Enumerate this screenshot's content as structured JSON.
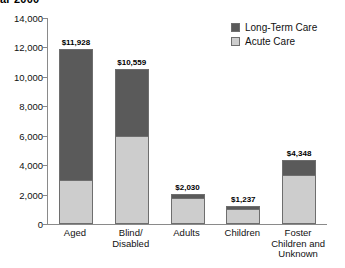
{
  "chart_data": {
    "type": "bar",
    "title": "ar 2000",
    "xlabel": "",
    "ylabel": "",
    "ylim": [
      0,
      14000
    ],
    "ytick_step": 2000,
    "grid": false,
    "stacked": true,
    "legend_position": "top-right",
    "ytick_labels": [
      "14,000",
      "12,000",
      "10,000",
      "8,000",
      "6,000",
      "4,000",
      "2,000",
      "0"
    ],
    "ytick_values": [
      14000,
      12000,
      10000,
      8000,
      6000,
      4000,
      2000,
      0
    ],
    "categories": [
      "Aged",
      "Blind/ Disabled",
      "Adults",
      "Children",
      "Foster Children and Unknown"
    ],
    "category_lines": [
      [
        "Aged"
      ],
      [
        "Blind/",
        "Disabled"
      ],
      [
        "Adults"
      ],
      [
        "Children"
      ],
      [
        "Foster",
        "Children and",
        "Unknown"
      ]
    ],
    "series": [
      {
        "name": "Acute Care",
        "color": "#cdcdcd",
        "values": [
          3000,
          6000,
          1780,
          1050,
          3350
        ]
      },
      {
        "name": "Long-Term Care",
        "color": "#5a5a5a",
        "values": [
          8928,
          4559,
          250,
          187,
          998
        ]
      }
    ],
    "totals": [
      11928,
      10559,
      2030,
      1237,
      4348
    ],
    "total_labels": [
      "$11,928",
      "$10,559",
      "$2,030",
      "$1,237",
      "$4,348"
    ]
  },
  "legend": {
    "items": [
      {
        "label": "Long-Term Care",
        "color": "#5a5a5a"
      },
      {
        "label": "Acute Care",
        "color": "#cdcdcd"
      }
    ]
  }
}
